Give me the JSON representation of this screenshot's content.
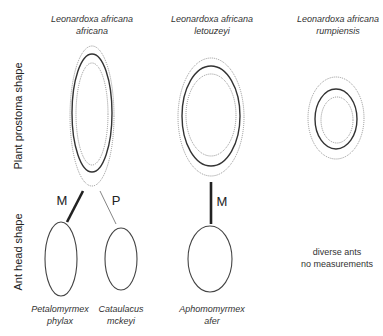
{
  "axes": {
    "plant_label": "Plant prostoma shape",
    "ant_label": "Ant head shape"
  },
  "plants": [
    {
      "line1": "Leonardoxa africana",
      "line2": "africana"
    },
    {
      "line1": "Leonardoxa africana",
      "line2": "letouzeyi"
    },
    {
      "line1": "Leonardoxa africana",
      "line2": "rumpiensis"
    }
  ],
  "links": {
    "m_left": "M",
    "p_left": "P",
    "m_middle": "M"
  },
  "ants": [
    {
      "line1": "Petalomyrmex",
      "line2": "phylax"
    },
    {
      "line1": "Cataulacus",
      "line2": "mckeyi"
    },
    {
      "line1": "Aphomomyrmex",
      "line2": "afer"
    }
  ],
  "note": {
    "line1": "diverse ants",
    "line2": "no measurements"
  },
  "colors": {
    "solid_stroke": "#333333",
    "dotted_stroke": "#888888"
  }
}
